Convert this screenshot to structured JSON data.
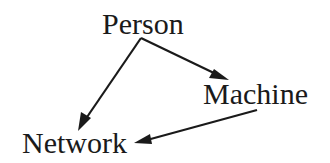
{
  "diagram": {
    "type": "directed-graph",
    "nodes": [
      {
        "id": "person",
        "label": "Person"
      },
      {
        "id": "machine",
        "label": "Machine"
      },
      {
        "id": "network",
        "label": "Network"
      }
    ],
    "edges": [
      {
        "from": "Person",
        "to": "Machine"
      },
      {
        "from": "Person",
        "to": "Network"
      },
      {
        "from": "Machine",
        "to": "Network"
      }
    ],
    "colors": {
      "ink": "#1a1a1a",
      "background": "#ffffff"
    }
  }
}
